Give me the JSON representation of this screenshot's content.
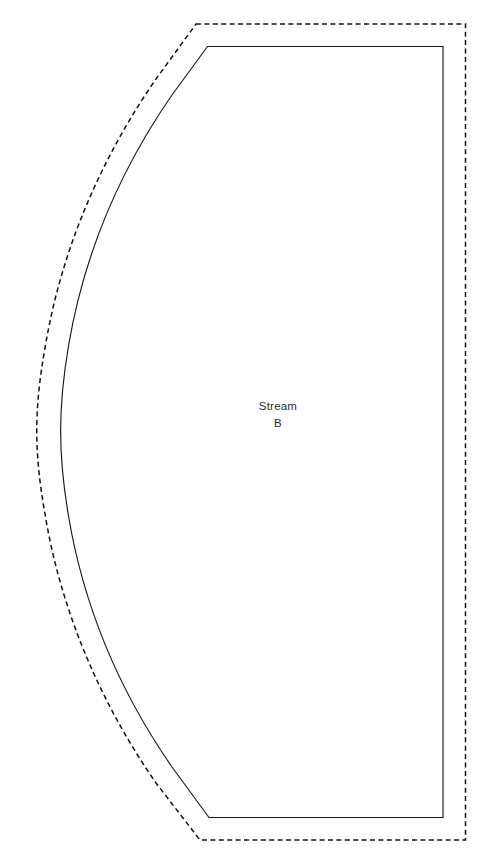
{
  "diagram": {
    "canvas": {
      "width": 486,
      "height": 861,
      "background": "#ffffff"
    },
    "colors": {
      "region_stroke": "#1a1a1a",
      "boundary_stroke": "#111111",
      "label_text": "#2b2b2b",
      "background": "#ffffff"
    },
    "region": {
      "name": "Stream B",
      "label_line_1": "Stream",
      "label_line_2": "B",
      "label_position": {
        "x": 278,
        "y": 410
      },
      "stroke_style": "solid",
      "stroke_width": 1.15,
      "path": "M 207.5 46.5 L 443 46.5 L 443 817.5 L 209 817.5 L 172 767 C 120 692 84 608 68.5 516 C 58 454 58 408 68.5 346 C 84 254 120 170 172 95 Z"
    },
    "boundary": {
      "name": "Offset boundary",
      "stroke_style": "dashed",
      "dash_pattern": "5 3.4",
      "stroke_width": 1.5,
      "offset_px": 23,
      "path": "M 196 24 L 465.5 24 L 465.5 840 L 200 840 L 156 783 C 100 702 61 611 45 514 C 34 452 34 410 45 348 C 61 251 100 160 156 79 Z"
    }
  }
}
